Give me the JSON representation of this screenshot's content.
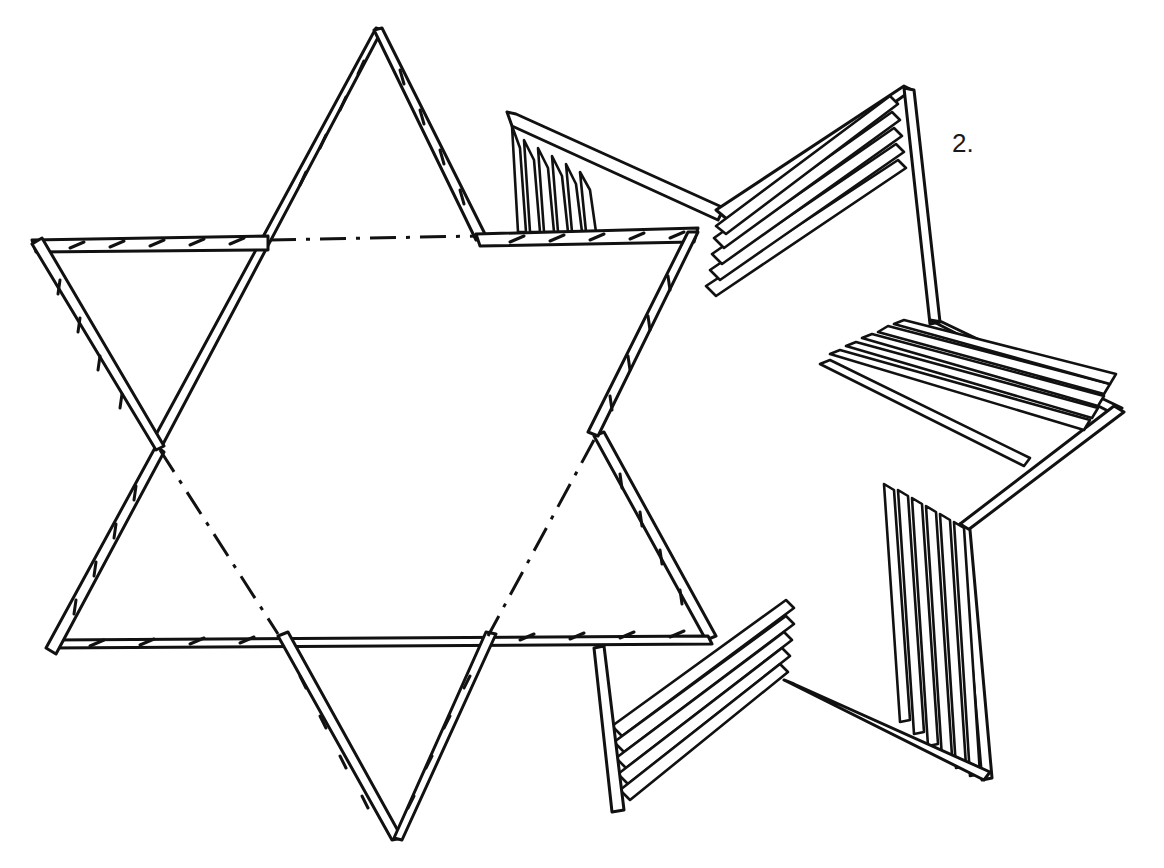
{
  "figure": {
    "step_label": "2.",
    "stroke_color": "#111111",
    "background": "#ffffff"
  }
}
